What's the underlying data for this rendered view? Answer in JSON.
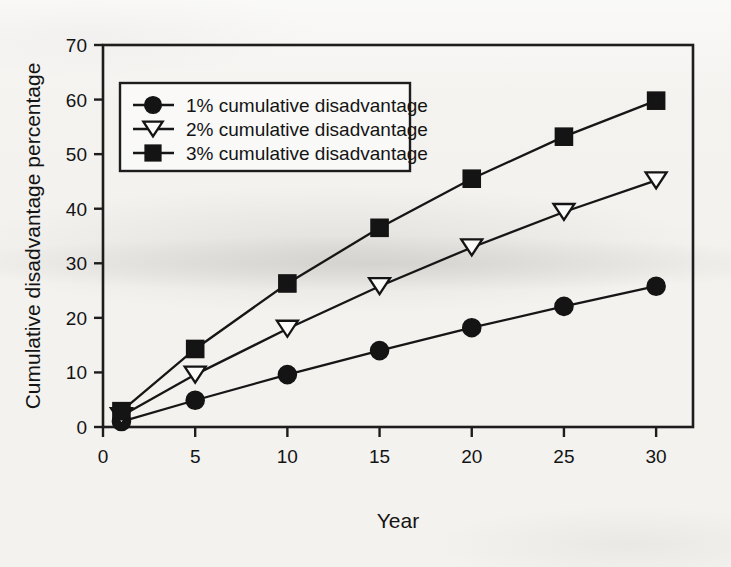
{
  "chart_data": {
    "type": "line",
    "title": "",
    "subtitle": "",
    "xlabel": "Year",
    "ylabel": "Cumulative disadvantage percentage",
    "x": [
      1,
      5,
      10,
      15,
      20,
      25,
      30
    ],
    "xlim": [
      0,
      32
    ],
    "ylim": [
      0,
      70
    ],
    "xticks": [
      0,
      5,
      10,
      15,
      20,
      25,
      30
    ],
    "yticks": [
      0,
      10,
      20,
      30,
      40,
      50,
      60,
      70
    ],
    "xticklabels": [
      "0",
      "5",
      "10",
      "15",
      "20",
      "25",
      "30"
    ],
    "yticklabels": [
      "0",
      "10",
      "20",
      "30",
      "40",
      "50",
      "60",
      "70"
    ],
    "grid": false,
    "legend_position": "upper-left-inside",
    "series": [
      {
        "name": "1% cumulative disadvantage",
        "marker": "filled-circle",
        "color": "#141414",
        "values": [
          1.0,
          4.9,
          9.6,
          14.0,
          18.2,
          22.1,
          25.8
        ]
      },
      {
        "name": "2% cumulative disadvantage",
        "marker": "open-triangle-down",
        "color": "#141414",
        "values": [
          2.0,
          9.6,
          18.0,
          25.8,
          32.9,
          39.4,
          45.2
        ]
      },
      {
        "name": "3% cumulative disadvantage",
        "marker": "filled-square",
        "color": "#141414",
        "values": [
          2.9,
          14.3,
          26.3,
          36.5,
          45.5,
          53.2,
          59.8
        ]
      }
    ]
  },
  "legend": {
    "items": [
      {
        "label": "1% cumulative disadvantage"
      },
      {
        "label": "2% cumulative disadvantage"
      },
      {
        "label": "3% cumulative disadvantage"
      }
    ]
  },
  "axes": {
    "x_title": "Year",
    "y_title": "Cumulative disadvantage percentage"
  }
}
